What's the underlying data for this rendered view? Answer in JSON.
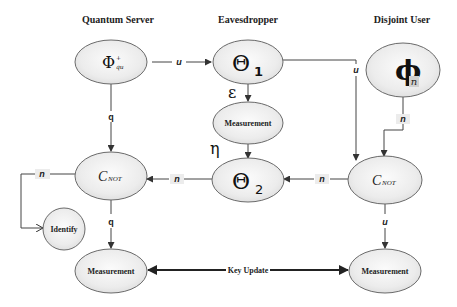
{
  "columns": {
    "server": "Quantum Server",
    "eavesdropper": "Eavesdropper",
    "user": "Disjoint User"
  },
  "nodes": {
    "phi_qu": {
      "symbol": "Φ",
      "sup": "+",
      "sub": "qu"
    },
    "theta1": {
      "symbol": "Θ",
      "sub": "1"
    },
    "phi_n": {
      "symbol": "ϕ",
      "sub": "n"
    },
    "eav_measurement": "Measurement",
    "theta2": {
      "symbol": "Θ",
      "sub": "2"
    },
    "cnot_left": {
      "main": "C",
      "sub": "NOT"
    },
    "cnot_right": {
      "main": "C",
      "sub": "NOT"
    },
    "identify": "Identify",
    "measurement_left": "Measurement",
    "measurement_right": "Measurement"
  },
  "edges": {
    "phi_to_theta1": "u",
    "theta1_to_cnot_right": "u",
    "theta1_to_measure_greek": "ε",
    "measure_to_theta2_greek": "η",
    "phi_to_cnot_left": "q",
    "phin_to_cnot_right": "n",
    "cnot_right_to_theta2": "n",
    "theta2_to_cnot_left": "n",
    "cnot_left_to_identify": "n",
    "cnot_left_to_measure": "q",
    "cnot_right_to_measure": "u",
    "key_update": "Key Update"
  }
}
